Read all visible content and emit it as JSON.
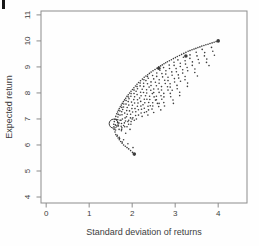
{
  "figure": {
    "background": "#fefefe",
    "page_mark_color": "#161616"
  },
  "chart_data": {
    "type": "scatter",
    "title": "",
    "xlabel": "Standard deviation of returns",
    "ylabel": "Expected return",
    "xlim": [
      -0.12,
      4.67
    ],
    "ylim": [
      3.77,
      11.15
    ],
    "xticks": [
      0,
      1,
      2,
      3,
      4
    ],
    "yticks": [
      4,
      5,
      6,
      7,
      8,
      9,
      10,
      11
    ],
    "grid": false,
    "legend": null,
    "point_color": "#3c3c3c",
    "frame_color": "#8c8c8c",
    "label_color": "#3d3d3d",
    "frontier": [
      [
        4.0,
        10.0
      ],
      [
        3.62,
        9.8
      ],
      [
        3.3,
        9.6
      ],
      [
        3.05,
        9.4
      ],
      [
        2.82,
        9.2
      ],
      [
        2.62,
        9.0
      ],
      [
        2.44,
        8.8
      ],
      [
        2.28,
        8.6
      ],
      [
        2.15,
        8.4
      ],
      [
        2.04,
        8.2
      ],
      [
        1.94,
        8.0
      ],
      [
        1.85,
        7.8
      ],
      [
        1.77,
        7.6
      ],
      [
        1.7,
        7.4
      ],
      [
        1.64,
        7.2
      ],
      [
        1.6,
        7.0
      ],
      [
        1.57,
        6.8
      ],
      [
        1.58,
        6.6
      ],
      [
        1.62,
        6.4
      ],
      [
        1.7,
        6.2
      ],
      [
        1.8,
        6.0
      ],
      [
        1.92,
        5.85
      ],
      [
        2.05,
        5.65
      ]
    ],
    "whiskers": [
      {
        "y": 9.9,
        "dx": 0.1,
        "dy": 0.45
      },
      {
        "y": 9.8,
        "dx": 0.15,
        "dy": 0.75
      },
      {
        "y": 9.7,
        "dx": 0.1,
        "dy": 0.55
      },
      {
        "y": 9.6,
        "dx": 0.2,
        "dy": 0.95
      },
      {
        "y": 9.5,
        "dx": 0.12,
        "dy": 0.65
      },
      {
        "y": 9.4,
        "dx": 0.25,
        "dy": 1.15
      },
      {
        "y": 9.3,
        "dx": 0.18,
        "dy": 0.85
      },
      {
        "y": 9.2,
        "dx": 0.3,
        "dy": 1.3
      },
      {
        "y": 9.1,
        "dx": 0.2,
        "dy": 1.0
      },
      {
        "y": 9.0,
        "dx": 0.35,
        "dy": 1.4
      },
      {
        "y": 8.9,
        "dx": 0.22,
        "dy": 1.05
      },
      {
        "y": 8.8,
        "dx": 0.32,
        "dy": 1.3
      },
      {
        "y": 8.7,
        "dx": 0.25,
        "dy": 1.1
      },
      {
        "y": 8.6,
        "dx": 0.38,
        "dy": 1.25
      },
      {
        "y": 8.5,
        "dx": 0.28,
        "dy": 1.0
      },
      {
        "y": 8.4,
        "dx": 0.35,
        "dy": 1.15
      },
      {
        "y": 8.3,
        "dx": 0.3,
        "dy": 0.95
      },
      {
        "y": 8.2,
        "dx": 0.33,
        "dy": 1.05
      },
      {
        "y": 8.1,
        "dx": 0.28,
        "dy": 0.85
      },
      {
        "y": 8.0,
        "dx": 0.3,
        "dy": 0.9
      },
      {
        "y": 7.9,
        "dx": 0.24,
        "dy": 0.75
      },
      {
        "y": 7.8,
        "dx": 0.26,
        "dy": 0.8
      },
      {
        "y": 7.7,
        "dx": 0.2,
        "dy": 0.65
      },
      {
        "y": 7.6,
        "dx": 0.22,
        "dy": 0.7
      },
      {
        "y": 7.5,
        "dx": 0.18,
        "dy": 0.55
      },
      {
        "y": 7.4,
        "dx": 0.2,
        "dy": 0.6
      },
      {
        "y": 7.3,
        "dx": 0.15,
        "dy": 0.45
      },
      {
        "y": 7.2,
        "dx": 0.17,
        "dy": 0.5
      },
      {
        "y": 7.1,
        "dx": 0.12,
        "dy": 0.38
      },
      {
        "y": 7.0,
        "dx": 0.14,
        "dy": 0.4
      },
      {
        "y": 6.9,
        "dx": 0.1,
        "dy": 0.3
      }
    ],
    "bold_points": [
      [
        4.0,
        10.0
      ],
      [
        3.25,
        9.42
      ],
      [
        2.62,
        8.95
      ],
      [
        2.05,
        5.65
      ]
    ],
    "min_variance_marker": {
      "x": 1.57,
      "y": 6.82,
      "radius_px": 4.5
    },
    "stray_dots": [
      [
        1.75,
        6.55
      ],
      [
        1.85,
        6.45
      ],
      [
        1.95,
        6.6
      ],
      [
        1.8,
        6.75
      ],
      [
        1.9,
        6.9
      ],
      [
        2.0,
        7.0
      ],
      [
        1.7,
        6.3
      ],
      [
        1.8,
        6.2
      ],
      [
        1.9,
        6.05
      ],
      [
        2.02,
        5.9
      ],
      [
        1.76,
        6.66
      ],
      [
        1.88,
        6.7
      ],
      [
        1.97,
        6.8
      ],
      [
        2.05,
        6.95
      ],
      [
        1.72,
        6.95
      ]
    ]
  }
}
